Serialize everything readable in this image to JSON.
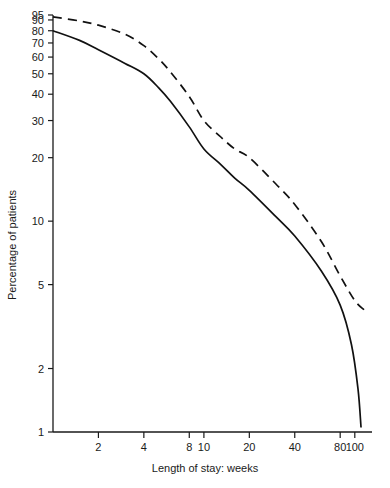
{
  "chart_data": {
    "type": "line",
    "title": "",
    "xlabel": "Length of stay:  weeks",
    "ylabel": "Percentage of patients",
    "x_scale": "log",
    "y_scale": "log",
    "xlim": [
      1,
      130
    ],
    "ylim": [
      1,
      95
    ],
    "grid": false,
    "legend": "none",
    "x_ticks": [
      2,
      4,
      8,
      10,
      20,
      40,
      80,
      100
    ],
    "x_tick_labels": [
      "2",
      "4",
      "8",
      "10",
      "20",
      "40",
      "80",
      "100"
    ],
    "y_ticks": [
      1,
      2,
      5,
      10,
      20,
      30,
      40,
      50,
      60,
      70,
      80,
      90,
      95
    ],
    "y_tick_labels": [
      "1",
      "2",
      "5",
      "10",
      "20",
      "30",
      "40",
      "50",
      "60",
      "70",
      "80",
      "90",
      "95"
    ],
    "series": [
      {
        "name": "upper-dashed-curve",
        "style": "dashed",
        "color": "#111111",
        "points": [
          {
            "x": 1.0,
            "y": 93
          },
          {
            "x": 1.5,
            "y": 89
          },
          {
            "x": 2.0,
            "y": 85
          },
          {
            "x": 3.0,
            "y": 77
          },
          {
            "x": 4.0,
            "y": 68
          },
          {
            "x": 5.0,
            "y": 59
          },
          {
            "x": 6.0,
            "y": 51
          },
          {
            "x": 8.0,
            "y": 39
          },
          {
            "x": 10.0,
            "y": 30
          },
          {
            "x": 13.0,
            "y": 25
          },
          {
            "x": 16.0,
            "y": 22
          },
          {
            "x": 20.0,
            "y": 20
          },
          {
            "x": 30.0,
            "y": 15
          },
          {
            "x": 40.0,
            "y": 12
          },
          {
            "x": 60.0,
            "y": 8
          },
          {
            "x": 80.0,
            "y": 5.5
          },
          {
            "x": 100.0,
            "y": 4.2
          },
          {
            "x": 115.0,
            "y": 3.8
          }
        ]
      },
      {
        "name": "lower-solid-curve",
        "style": "solid",
        "color": "#111111",
        "points": [
          {
            "x": 1.0,
            "y": 80
          },
          {
            "x": 1.5,
            "y": 72
          },
          {
            "x": 2.0,
            "y": 65
          },
          {
            "x": 3.0,
            "y": 56
          },
          {
            "x": 4.0,
            "y": 50
          },
          {
            "x": 5.0,
            "y": 43
          },
          {
            "x": 6.0,
            "y": 37
          },
          {
            "x": 8.0,
            "y": 28
          },
          {
            "x": 10.0,
            "y": 22
          },
          {
            "x": 13.0,
            "y": 18.5
          },
          {
            "x": 16.0,
            "y": 16
          },
          {
            "x": 20.0,
            "y": 14
          },
          {
            "x": 30.0,
            "y": 10.5
          },
          {
            "x": 40.0,
            "y": 8.5
          },
          {
            "x": 60.0,
            "y": 5.8
          },
          {
            "x": 80.0,
            "y": 4.0
          },
          {
            "x": 95.0,
            "y": 2.6
          },
          {
            "x": 105.0,
            "y": 1.6
          },
          {
            "x": 110.0,
            "y": 1.05
          }
        ]
      }
    ]
  }
}
